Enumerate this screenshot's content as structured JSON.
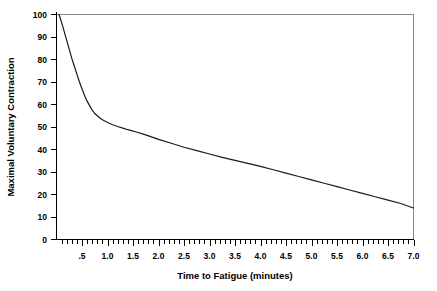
{
  "chart_data": {
    "type": "line",
    "title": "",
    "subtitle": "",
    "xlabel": "Time to Fatigue (minutes)",
    "ylabel": "Maximal Voluntary Contraction",
    "xlim": [
      0,
      7.0
    ],
    "ylim": [
      0,
      100
    ],
    "grid": false,
    "legend": "none",
    "x_tick_labels": [
      ".5",
      "1.0",
      "1.5",
      "2.0",
      "2.5",
      "3.0",
      "3.5",
      "4.0",
      "4.5",
      "5.0",
      "5.5",
      "6.0",
      "6.5",
      "7.0"
    ],
    "x_tick_values": [
      0.5,
      1.0,
      1.5,
      2.0,
      2.5,
      3.0,
      3.5,
      4.0,
      4.5,
      5.0,
      5.5,
      6.0,
      6.5,
      7.0
    ],
    "x_minor_tick_step": 0.1,
    "y_tick_labels": [
      "0",
      "10",
      "20",
      "30",
      "40",
      "50",
      "60",
      "70",
      "80",
      "90",
      "100"
    ],
    "y_tick_values": [
      0,
      10,
      20,
      30,
      40,
      50,
      60,
      70,
      80,
      90,
      100
    ],
    "series": [
      {
        "name": "Maximal Voluntary Contraction",
        "color": "#1a1a1a",
        "x": [
          0.05,
          0.1,
          0.15,
          0.2,
          0.25,
          0.3,
          0.35,
          0.4,
          0.45,
          0.5,
          0.55,
          0.6,
          0.65,
          0.7,
          0.75,
          0.8,
          0.85,
          0.9,
          1.0,
          1.1,
          1.2,
          1.3,
          1.4,
          1.5,
          1.75,
          2.0,
          2.25,
          2.5,
          2.75,
          3.0,
          3.25,
          3.5,
          3.75,
          4.0,
          4.25,
          4.5,
          4.75,
          5.0,
          5.25,
          5.5,
          5.75,
          6.0,
          6.25,
          6.5,
          6.75,
          7.0
        ],
        "y": [
          100,
          96.5,
          92.5,
          88.5,
          84.5,
          80.5,
          77,
          73.5,
          70,
          67,
          64,
          61.5,
          59.5,
          57.5,
          56,
          55,
          54,
          53.2,
          52,
          51,
          50.2,
          49.5,
          48.8,
          48.2,
          46.5,
          44.5,
          42.8,
          41,
          39.5,
          38,
          36.5,
          35.2,
          33.8,
          32.5,
          31,
          29.5,
          28,
          26.5,
          25,
          23.5,
          22,
          20.5,
          19,
          17.5,
          16,
          14
        ]
      }
    ]
  },
  "labels": {
    "y_axis_title": "Maximal Voluntary Contraction",
    "x_axis_title": "Time to Fatigue (minutes)"
  }
}
